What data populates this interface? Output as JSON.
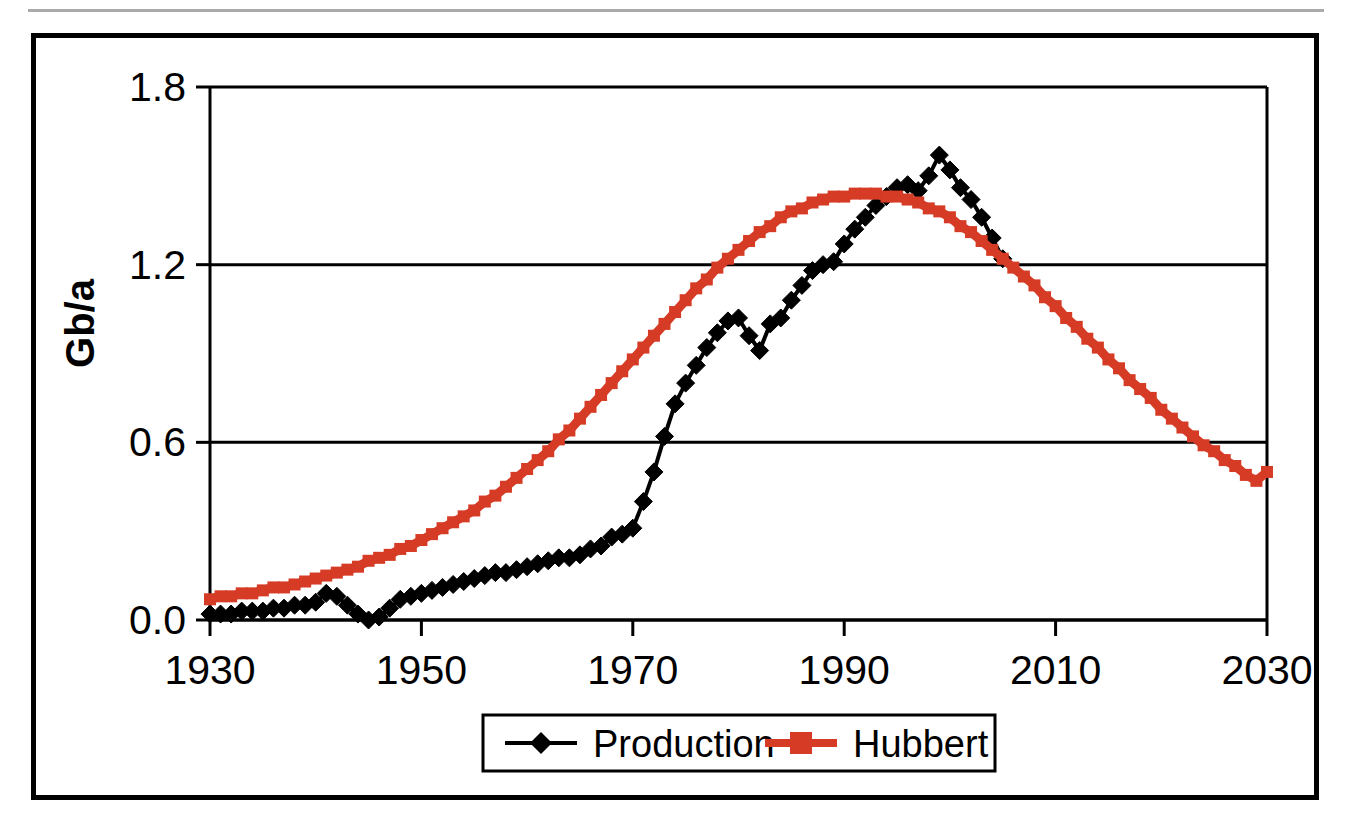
{
  "figure": {
    "has_top_rule": true,
    "border_color": "#000000",
    "background": "#ffffff"
  },
  "chart_data": {
    "type": "line",
    "title": "",
    "subtitle": "",
    "xlabel": "",
    "ylabel": "Gb/a",
    "xlim": [
      1930,
      2030
    ],
    "ylim": [
      0.0,
      1.8
    ],
    "xticks": [
      1930,
      1950,
      1970,
      1990,
      2010,
      2030
    ],
    "xtick_labels": [
      "1930",
      "1950",
      "1970",
      "1990",
      "2010",
      "2030"
    ],
    "yticks": [
      0.0,
      0.6,
      1.2,
      1.8
    ],
    "ytick_labels": [
      "0.0",
      "0.6",
      "1.2",
      "1.8"
    ],
    "grid": "horizontal",
    "legend_position": "bottom-center",
    "series": [
      {
        "name": "Production",
        "color": "#000000",
        "marker": "diamond",
        "x": [
          1930,
          1931,
          1932,
          1933,
          1934,
          1935,
          1936,
          1937,
          1938,
          1939,
          1940,
          1941,
          1942,
          1943,
          1944,
          1945,
          1946,
          1947,
          1948,
          1949,
          1950,
          1951,
          1952,
          1953,
          1954,
          1955,
          1956,
          1957,
          1958,
          1959,
          1960,
          1961,
          1962,
          1963,
          1964,
          1965,
          1966,
          1967,
          1968,
          1969,
          1970,
          1971,
          1972,
          1973,
          1974,
          1975,
          1976,
          1977,
          1978,
          1979,
          1980,
          1981,
          1982,
          1983,
          1984,
          1985,
          1986,
          1987,
          1988,
          1989,
          1990,
          1991,
          1992,
          1993,
          1994,
          1995,
          1996,
          1997,
          1998,
          1999,
          2000,
          2001,
          2002,
          2003,
          2004,
          2005
        ],
        "y": [
          0.02,
          0.02,
          0.02,
          0.03,
          0.03,
          0.03,
          0.04,
          0.04,
          0.05,
          0.05,
          0.06,
          0.09,
          0.08,
          0.05,
          0.02,
          0.0,
          0.01,
          0.04,
          0.07,
          0.08,
          0.09,
          0.1,
          0.11,
          0.12,
          0.13,
          0.14,
          0.15,
          0.16,
          0.16,
          0.17,
          0.18,
          0.19,
          0.2,
          0.21,
          0.21,
          0.22,
          0.24,
          0.25,
          0.28,
          0.29,
          0.31,
          0.4,
          0.5,
          0.62,
          0.73,
          0.8,
          0.86,
          0.92,
          0.97,
          1.01,
          1.02,
          0.96,
          0.91,
          1.0,
          1.02,
          1.08,
          1.13,
          1.18,
          1.2,
          1.21,
          1.27,
          1.32,
          1.36,
          1.4,
          1.43,
          1.46,
          1.47,
          1.45,
          1.5,
          1.57,
          1.52,
          1.46,
          1.42,
          1.36,
          1.29,
          1.22
        ]
      },
      {
        "name": "Hubbert",
        "color": "#D63B25",
        "marker": "square",
        "x": [
          1930,
          1931,
          1932,
          1933,
          1934,
          1935,
          1936,
          1937,
          1938,
          1939,
          1940,
          1941,
          1942,
          1943,
          1944,
          1945,
          1946,
          1947,
          1948,
          1949,
          1950,
          1951,
          1952,
          1953,
          1954,
          1955,
          1956,
          1957,
          1958,
          1959,
          1960,
          1961,
          1962,
          1963,
          1964,
          1965,
          1966,
          1967,
          1968,
          1969,
          1970,
          1971,
          1972,
          1973,
          1974,
          1975,
          1976,
          1977,
          1978,
          1979,
          1980,
          1981,
          1982,
          1983,
          1984,
          1985,
          1986,
          1987,
          1988,
          1989,
          1990,
          1991,
          1992,
          1993,
          1994,
          1995,
          1996,
          1997,
          1998,
          1999,
          2000,
          2001,
          2002,
          2003,
          2004,
          2005,
          2006,
          2007,
          2008,
          2009,
          2010,
          2011,
          2012,
          2013,
          2014,
          2015,
          2016,
          2017,
          2018,
          2019,
          2020,
          2021,
          2022,
          2023,
          2024,
          2025,
          2026,
          2027,
          2028,
          2029,
          2030
        ],
        "y": [
          0.07,
          0.08,
          0.08,
          0.09,
          0.09,
          0.1,
          0.11,
          0.11,
          0.12,
          0.13,
          0.14,
          0.15,
          0.16,
          0.17,
          0.18,
          0.2,
          0.21,
          0.22,
          0.24,
          0.25,
          0.27,
          0.29,
          0.31,
          0.33,
          0.35,
          0.37,
          0.4,
          0.42,
          0.45,
          0.48,
          0.51,
          0.54,
          0.57,
          0.61,
          0.64,
          0.68,
          0.72,
          0.76,
          0.8,
          0.84,
          0.88,
          0.92,
          0.96,
          1.0,
          1.04,
          1.08,
          1.12,
          1.15,
          1.19,
          1.22,
          1.25,
          1.28,
          1.31,
          1.33,
          1.36,
          1.38,
          1.39,
          1.41,
          1.42,
          1.43,
          1.43,
          1.44,
          1.44,
          1.44,
          1.43,
          1.43,
          1.42,
          1.41,
          1.39,
          1.38,
          1.36,
          1.33,
          1.31,
          1.28,
          1.25,
          1.22,
          1.19,
          1.16,
          1.13,
          1.09,
          1.06,
          1.02,
          0.99,
          0.95,
          0.92,
          0.88,
          0.85,
          0.81,
          0.78,
          0.75,
          0.71,
          0.68,
          0.65,
          0.62,
          0.59,
          0.57,
          0.54,
          0.52,
          0.49,
          0.47,
          0.5
        ]
      }
    ]
  },
  "legend": {
    "items": [
      {
        "label": "Production",
        "color": "#000000",
        "marker": "diamond"
      },
      {
        "label": "Hubbert",
        "color": "#D63B25",
        "marker": "square"
      }
    ]
  }
}
